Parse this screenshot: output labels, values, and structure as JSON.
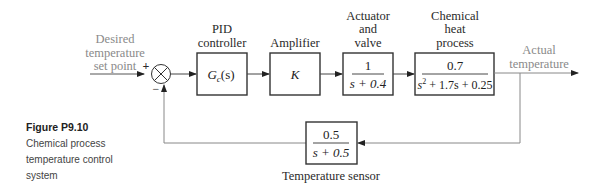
{
  "figure": {
    "label": "Figure P9.10",
    "caption": [
      "Chemical process",
      "temperature control",
      "system"
    ]
  },
  "input": {
    "label_lines": [
      "Desired",
      "temperature",
      "set point"
    ]
  },
  "summing_junction": {
    "plus": "+",
    "minus": "−"
  },
  "blocks": [
    {
      "id": "pid",
      "title_lines": [
        "PID",
        "controller"
      ],
      "tf": "Gc(s)",
      "tf_main": "G",
      "tf_sub": "c",
      "tf_arg": "(s)"
    },
    {
      "id": "amplifier",
      "title_lines": [
        "Amplifier"
      ],
      "tf": "K"
    },
    {
      "id": "actuator",
      "title_lines": [
        "Actuator",
        "and",
        "valve"
      ],
      "numerator": "1",
      "denominator": "s + 0.4"
    },
    {
      "id": "process",
      "title_lines": [
        "Chemical",
        "heat",
        "process"
      ],
      "numerator": "0.7",
      "denominator_pre": "s",
      "denominator_exp": "2",
      "denominator_post": " + 1.7s + 0.25"
    }
  ],
  "feedback": {
    "title": "Temperature sensor",
    "numerator": "0.5",
    "denominator": "s + 0.5"
  },
  "output": {
    "label_lines": [
      "Actual",
      "temperature"
    ]
  },
  "colors": {
    "line": "#333333",
    "gray_signal": "#8a8a8a"
  }
}
